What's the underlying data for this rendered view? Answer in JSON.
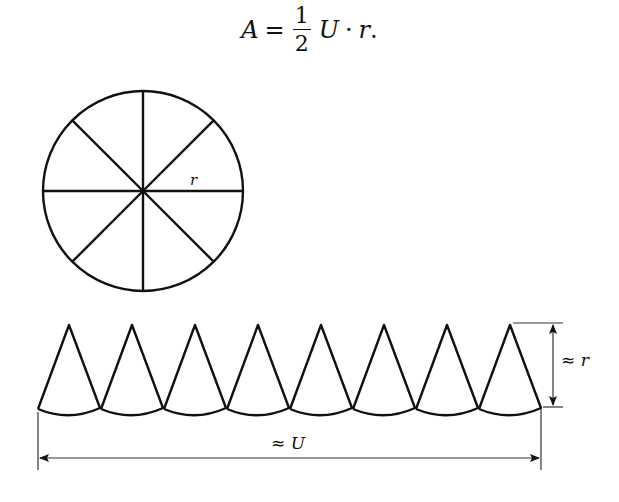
{
  "formula": {
    "lhs": "A",
    "equals": "=",
    "fraction_numerator": "1",
    "fraction_denominator": "2",
    "term1": "U",
    "dot": "·",
    "term2": "r",
    "trailing": "."
  },
  "circle": {
    "center": [
      143,
      191
    ],
    "radius": 100,
    "sectors": 8,
    "radius_label": "r"
  },
  "sector_strip": {
    "count": 8,
    "apex_y": 325,
    "base_y": 409,
    "first_apex_x": 69,
    "spacing": 63,
    "base_half_width": 31
  },
  "dimensions": {
    "height_label": "≈ r",
    "width_label": "≈ U"
  },
  "colors": {
    "stroke": "#111111",
    "background": "#ffffff",
    "dimension_stroke": "#333333"
  }
}
